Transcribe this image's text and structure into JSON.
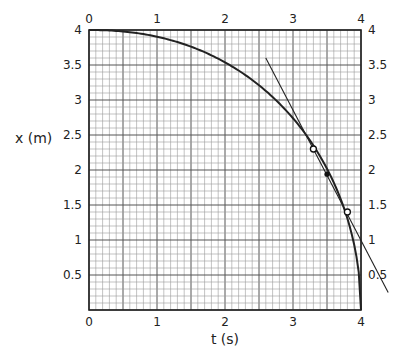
{
  "chart_data": {
    "type": "line",
    "title": "",
    "xlabel": "t (s)",
    "ylabel": "x (m)",
    "xlim": [
      0,
      4
    ],
    "ylim": [
      0,
      4
    ],
    "x_ticks": [
      "0",
      "1",
      "2",
      "3",
      "4"
    ],
    "y_ticks": [
      "0.5",
      "1",
      "1.5",
      "2",
      "2.5",
      "3",
      "3.5",
      "4"
    ],
    "grid": {
      "major_step": 0.5,
      "minor_step": 0.1,
      "on": true
    },
    "series": [
      {
        "name": "x(t) curve",
        "x": [
          0,
          0.5,
          1,
          1.5,
          2,
          2.5,
          3,
          3.3,
          3.5,
          3.8,
          3.9,
          4
        ],
        "values": [
          4,
          3.97,
          3.87,
          3.71,
          3.46,
          3.12,
          2.65,
          2.27,
          1.94,
          1.25,
          0.88,
          0
        ]
      },
      {
        "name": "tangent line",
        "x": [
          2.6,
          4.4
        ],
        "values": [
          3.6,
          0.25
        ]
      }
    ],
    "markers": [
      {
        "type": "open-circle",
        "t": 3.3,
        "x": 2.3
      },
      {
        "type": "filled-dot",
        "t": 3.5,
        "x": 1.94
      },
      {
        "type": "open-circle",
        "t": 3.8,
        "x": 1.4
      }
    ]
  },
  "labels": {
    "xlabel": "t (s)",
    "ylabel": "x (m)",
    "x_ticks": [
      "0",
      "1",
      "2",
      "3",
      "4"
    ],
    "y_ticks_left": [
      "4",
      "3.5",
      "3",
      "2.5",
      "2",
      "1.5",
      "1",
      "0.5"
    ],
    "y_ticks_right": [
      "4",
      "3.5",
      "3",
      "2.5",
      "2",
      "1.5",
      "1",
      "0.5"
    ]
  }
}
